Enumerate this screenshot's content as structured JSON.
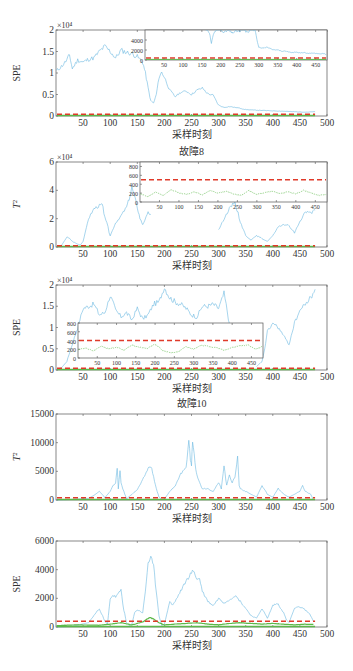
{
  "figure": {
    "x_axis_label": "采样时刻",
    "colors": {
      "statistic": "#6bb8e0",
      "control_limit": "#e03a2a",
      "improved_statistic": "#5cb84a",
      "axes": "#555555"
    }
  },
  "chart_data": [
    {
      "id": "panel1",
      "type": "line",
      "title": "",
      "ylabel": "SPE",
      "y_exponent": "×10⁴",
      "xlim": [
        0,
        500
      ],
      "ylim": [
        0,
        20000
      ],
      "xticks": [
        50,
        100,
        150,
        200,
        250,
        300,
        350,
        400,
        450,
        500
      ],
      "yticks": [
        0,
        0.5,
        1,
        1.5,
        2
      ],
      "ytick_scale": 10000,
      "control_limit": 400,
      "series": [
        {
          "name": "SPE",
          "x": [
            1,
            10,
            20,
            25,
            30,
            40,
            50,
            60,
            70,
            80,
            90,
            100,
            110,
            120,
            130,
            140,
            150,
            160,
            165,
            170,
            175,
            180,
            185,
            190,
            195,
            200,
            210,
            220,
            230,
            240,
            250,
            260,
            270,
            280,
            290,
            300,
            310,
            320,
            330,
            340,
            350,
            360,
            380,
            400,
            420,
            440,
            460,
            478
          ],
          "values": [
            10500,
            11500,
            13000,
            14200,
            11000,
            13000,
            12500,
            13200,
            13500,
            15000,
            16200,
            15000,
            13500,
            15300,
            14800,
            14500,
            13800,
            12500,
            10000,
            6500,
            3500,
            3000,
            5000,
            9000,
            10200,
            9000,
            6000,
            4500,
            5500,
            5800,
            5000,
            6000,
            6500,
            5200,
            4800,
            2500,
            2000,
            2200,
            2000,
            1800,
            1500,
            1400,
            1300,
            1200,
            1100,
            1000,
            900,
            1000
          ]
        },
        {
          "name": "control limit",
          "style": "dashed",
          "values_const": 400
        },
        {
          "name": "improved",
          "values_const": 150
        }
      ],
      "inset": {
        "xlim": [
          0,
          480
        ],
        "ylim": [
          0,
          6000
        ],
        "yticks": [
          0,
          2000,
          4000
        ],
        "xticks": [
          50,
          100,
          150,
          200,
          250,
          300,
          350,
          400,
          450
        ],
        "control_limit": 400,
        "x": [
          160,
          170,
          175,
          180,
          190,
          200,
          210,
          220,
          230,
          240,
          250,
          260,
          270,
          280,
          290,
          295,
          300,
          310,
          320,
          330,
          340,
          350,
          360,
          370,
          380,
          390,
          400,
          410,
          420,
          430,
          440,
          450,
          460,
          470,
          478
        ],
        "values": [
          6500,
          5500,
          3200,
          5200,
          6200,
          6000,
          5600,
          5900,
          5400,
          5800,
          5700,
          6100,
          5500,
          6200,
          6000,
          4200,
          2600,
          2400,
          2500,
          2300,
          2000,
          2100,
          1700,
          1800,
          1600,
          1500,
          1600,
          1400,
          1500,
          1300,
          1400,
          1300,
          1200,
          1300,
          1100
        ]
      }
    },
    {
      "id": "panel2",
      "type": "line",
      "title": "故障8",
      "ylabel": "T²",
      "y_exponent": "×10⁴",
      "xlim": [
        0,
        500
      ],
      "ylim": [
        0,
        60000
      ],
      "xticks": [
        50,
        100,
        150,
        200,
        250,
        300,
        350,
        400,
        450,
        500
      ],
      "yticks": [
        0,
        2,
        4,
        6
      ],
      "ytick_scale": 10000,
      "control_limit": 500,
      "series": [
        {
          "name": "T2",
          "x": [
            1,
            10,
            20,
            25,
            30,
            40,
            45,
            50,
            60,
            70,
            80,
            85,
            90,
            100,
            110,
            120,
            130,
            135,
            140,
            150,
            155,
            160,
            170,
            175
          ],
          "values": [
            500,
            1000,
            7000,
            6000,
            4000,
            2000,
            1500,
            4000,
            20000,
            27000,
            29000,
            30000,
            22000,
            8000,
            17000,
            22000,
            28000,
            34000,
            42000,
            28000,
            20000,
            16000,
            24000,
            23000
          ]
        },
        {
          "name": "T2-tail",
          "x": [
            300,
            310,
            320,
            330,
            340,
            350,
            360,
            370,
            380,
            390,
            400,
            410,
            420,
            430,
            440,
            450,
            460,
            470,
            478
          ],
          "values": [
            12000,
            20000,
            27000,
            32000,
            18000,
            8000,
            5000,
            8000,
            6000,
            4000,
            8000,
            14000,
            16000,
            15000,
            10000,
            18000,
            25000,
            24000,
            26000
          ]
        }
      ],
      "inset": {
        "xlim": [
          0,
          480
        ],
        "ylim": [
          0,
          900
        ],
        "yticks": [
          0,
          200,
          400,
          600,
          800
        ],
        "xticks": [
          50,
          100,
          150,
          200,
          250,
          300,
          350,
          400,
          450
        ],
        "control_limit": 500,
        "green_x": [
          1,
          20,
          40,
          60,
          80,
          100,
          120,
          140,
          160,
          180,
          200,
          220,
          240,
          260,
          280,
          300,
          320,
          340,
          360,
          380,
          400,
          420,
          440,
          460,
          478
        ],
        "green_values": [
          180,
          120,
          220,
          150,
          280,
          200,
          170,
          230,
          160,
          260,
          200,
          240,
          180,
          150,
          260,
          170,
          210,
          240,
          190,
          230,
          180,
          260,
          200,
          150,
          170
        ]
      }
    },
    {
      "id": "panel3",
      "type": "line",
      "title": "",
      "ylabel": "SPE",
      "y_exponent": "×10⁴",
      "xlim": [
        0,
        500
      ],
      "ylim": [
        0,
        20000
      ],
      "xticks": [
        50,
        100,
        150,
        200,
        250,
        300,
        350,
        400,
        450,
        500
      ],
      "yticks": [
        0,
        0.5,
        1,
        1.5,
        2
      ],
      "ytick_scale": 10000,
      "control_limit": 400,
      "series": [
        {
          "name": "SPE",
          "x": [
            1,
            10,
            20,
            30,
            40,
            50,
            60,
            70,
            80,
            90,
            100,
            110,
            120,
            130,
            140,
            150,
            160,
            170,
            180,
            190,
            200,
            210,
            220,
            230,
            240,
            250,
            260,
            270,
            280,
            290,
            300,
            310,
            320
          ],
          "values": [
            200,
            500,
            2000,
            6000,
            10000,
            14500,
            15000,
            15500,
            13000,
            13500,
            17500,
            14000,
            12500,
            13500,
            11800,
            14500,
            12000,
            13000,
            15500,
            16000,
            19500,
            17000,
            16000,
            15500,
            14500,
            13000,
            12500,
            15000,
            15000,
            15500,
            14500,
            18000,
            11000
          ]
        },
        {
          "name": "SPE-tail",
          "x": [
            370,
            380,
            385,
            390,
            400,
            410,
            420,
            430,
            440,
            450,
            460,
            470,
            478
          ],
          "values": [
            800,
            2000,
            5000,
            9000,
            11000,
            10000,
            8000,
            6000,
            11000,
            14000,
            15500,
            17000,
            19000
          ]
        }
      ],
      "inset": {
        "xlim": [
          0,
          480
        ],
        "ylim": [
          0,
          800
        ],
        "yticks": [
          0,
          200,
          400,
          600,
          800
        ],
        "xticks": [
          50,
          100,
          150,
          200,
          250,
          300,
          350,
          400,
          450
        ],
        "control_limit": 400,
        "green_x": [
          1,
          20,
          40,
          60,
          80,
          100,
          120,
          140,
          160,
          180,
          200,
          220,
          240,
          260,
          280,
          300,
          320,
          340,
          360,
          380,
          400,
          420,
          440,
          460,
          478
        ],
        "green_values": [
          190,
          230,
          160,
          270,
          210,
          250,
          180,
          300,
          240,
          220,
          320,
          170,
          120,
          140,
          260,
          200,
          300,
          260,
          230,
          180,
          240,
          280,
          300,
          200,
          260
        ]
      }
    },
    {
      "id": "panel4",
      "type": "line",
      "title": "故障10",
      "ylabel": "T²",
      "y_exponent": "",
      "xlim": [
        0,
        500
      ],
      "ylim": [
        0,
        15000
      ],
      "xticks": [
        50,
        100,
        150,
        200,
        250,
        300,
        350,
        400,
        450,
        500
      ],
      "yticks": [
        0,
        5000,
        10000,
        15000
      ],
      "ytick_scale": 1,
      "control_limit": 400,
      "series": [
        {
          "name": "T2",
          "x": [
            1,
            30,
            60,
            70,
            80,
            90,
            100,
            105,
            110,
            113,
            115,
            118,
            120,
            125,
            130,
            140,
            150,
            160,
            165,
            170,
            175,
            180,
            185,
            190,
            195,
            200,
            210,
            220,
            230,
            240,
            245,
            248,
            250,
            252,
            255,
            258,
            260,
            265,
            270,
            280,
            290,
            300,
            305,
            310,
            315,
            320,
            325,
            330,
            335,
            338,
            340,
            350,
            360,
            370,
            380,
            390,
            400,
            410,
            420,
            430,
            440,
            450,
            455,
            460,
            470,
            475
          ],
          "values": [
            0,
            100,
            300,
            800,
            1500,
            400,
            1500,
            2500,
            3000,
            5500,
            2000,
            5000,
            3000,
            1500,
            200,
            1000,
            1800,
            3500,
            4500,
            5500,
            6000,
            4000,
            2000,
            500,
            100,
            200,
            1500,
            2500,
            4500,
            5500,
            10500,
            7000,
            6000,
            10500,
            8000,
            5500,
            4500,
            3000,
            2000,
            2000,
            1500,
            3000,
            2000,
            6000,
            2500,
            4500,
            3000,
            4000,
            7500,
            2500,
            2000,
            1500,
            1000,
            500,
            2500,
            1000,
            500,
            2000,
            1000,
            500,
            1000,
            1500,
            2500,
            1500,
            1000,
            0
          ]
        },
        {
          "name": "control limit",
          "style": "dashed",
          "values_const": 400
        },
        {
          "name": "improved",
          "values_const": 60
        }
      ]
    },
    {
      "id": "panel5",
      "type": "line",
      "title": "",
      "ylabel": "SPE",
      "y_exponent": "",
      "xlim": [
        0,
        500
      ],
      "ylim": [
        0,
        6000
      ],
      "xticks": [
        50,
        100,
        150,
        200,
        250,
        300,
        350,
        400,
        450,
        500
      ],
      "yticks": [
        0,
        2000,
        4000,
        6000
      ],
      "ytick_scale": 1,
      "control_limit": 400,
      "series": [
        {
          "name": "SPE",
          "x": [
            1,
            30,
            60,
            70,
            80,
            90,
            95,
            100,
            105,
            110,
            115,
            120,
            125,
            130,
            135,
            140,
            145,
            150,
            160,
            165,
            170,
            175,
            180,
            185,
            190,
            195,
            200,
            210,
            215,
            220,
            230,
            240,
            250,
            255,
            260,
            265,
            270,
            280,
            290,
            300,
            310,
            320,
            330,
            340,
            350,
            360,
            370,
            380,
            390,
            400,
            405,
            410,
            420,
            425,
            430,
            440,
            450,
            460,
            470,
            475
          ],
          "values": [
            0,
            50,
            300,
            800,
            1300,
            400,
            200,
            2000,
            2200,
            2100,
            2300,
            2600,
            1200,
            300,
            100,
            200,
            1000,
            1200,
            1000,
            2500,
            4500,
            4800,
            4200,
            2500,
            800,
            100,
            200,
            1800,
            1500,
            1800,
            2500,
            3200,
            3800,
            3900,
            3300,
            3400,
            2500,
            1800,
            1500,
            2000,
            1700,
            1900,
            2200,
            1800,
            1300,
            800,
            600,
            1300,
            600,
            1500,
            1600,
            1600,
            1000,
            500,
            300,
            1300,
            1400,
            1200,
            800,
            400
          ]
        },
        {
          "name": "control limit",
          "style": "dashed",
          "values_const": 400
        },
        {
          "name": "improved",
          "x": [
            1,
            40,
            80,
            100,
            120,
            140,
            160,
            170,
            175,
            180,
            190,
            200,
            220,
            240,
            260,
            280,
            300,
            320,
            340,
            360,
            380,
            400,
            420,
            440,
            460,
            475
          ],
          "values": [
            100,
            150,
            120,
            200,
            300,
            150,
            350,
            600,
            650,
            550,
            300,
            150,
            200,
            250,
            300,
            200,
            150,
            250,
            300,
            250,
            200,
            250,
            200,
            150,
            200,
            180
          ]
        }
      ]
    }
  ]
}
